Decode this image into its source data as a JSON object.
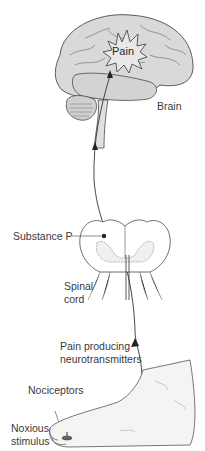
{
  "diagram": {
    "labels": {
      "pain": "Pain",
      "brain": "Brain",
      "substance_p": "Substance P",
      "spinal_cord_line1": "Spinal",
      "spinal_cord_line2": "cord",
      "neurotransmitters_line1": "Pain producing",
      "neurotransmitters_line2": "neurotransmitters",
      "nociceptors": "Nociceptors",
      "noxious_line1": "Noxious",
      "noxious_line2": "stimulus"
    },
    "colors": {
      "brain_fill": "#d9d9d9",
      "outline": "#4a4a4a",
      "text": "#3a3a3a",
      "background": "#ffffff"
    }
  }
}
